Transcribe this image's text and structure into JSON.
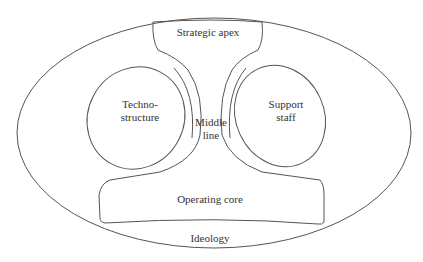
{
  "diagram": {
    "type": "mintzberg-organization-structure",
    "parts": {
      "strategic_apex": "Strategic apex",
      "technostructure_line1": "Techno-",
      "technostructure_line2": "structure",
      "support_staff_line1": "Support",
      "support_staff_line2": "staff",
      "middle_line_line1": "Middle",
      "middle_line_line2": "line",
      "operating_core": "Operating core",
      "ideology": "Ideology"
    },
    "colors": {
      "stroke": "#555555",
      "text": "#333333",
      "background": "#ffffff"
    }
  }
}
